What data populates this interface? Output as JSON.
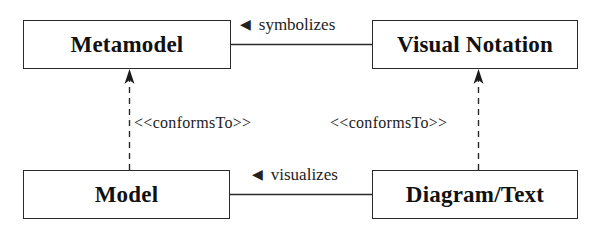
{
  "diagram": {
    "type": "metamodeling-relationship-diagram",
    "nodes": [
      {
        "id": "metamodel",
        "label": "Metamodel"
      },
      {
        "id": "visual_notation",
        "label": "Visual Notation"
      },
      {
        "id": "model",
        "label": "Model"
      },
      {
        "id": "diagram_text",
        "label": "Diagram/Text"
      }
    ],
    "edges": [
      {
        "from": "visual_notation",
        "to": "metamodel",
        "label": "symbolizes",
        "direction_marker": "◀",
        "style": "solid"
      },
      {
        "from": "diagram_text",
        "to": "model",
        "label": "visualizes",
        "direction_marker": "◀",
        "style": "solid"
      },
      {
        "from": "model",
        "to": "metamodel",
        "label": "<<conformsTo>>",
        "style": "dashed",
        "arrowhead": "open-filled"
      },
      {
        "from": "diagram_text",
        "to": "visual_notation",
        "label": "<<conformsTo>>",
        "style": "dashed",
        "arrowhead": "open-filled"
      }
    ]
  },
  "labels": {
    "metamodel": "Metamodel",
    "visual_notation": "Visual Notation",
    "model": "Model",
    "diagram_text": "Diagram/Text",
    "symbolizes": "symbolizes",
    "visualizes": "visualizes",
    "conforms_left": "<<conformsTo>>",
    "conforms_right": "<<conformsTo>>",
    "triangle_marker": "◀"
  },
  "colors": {
    "stroke": "#2a2a2a",
    "text": "#111111",
    "background": "#ffffff"
  }
}
